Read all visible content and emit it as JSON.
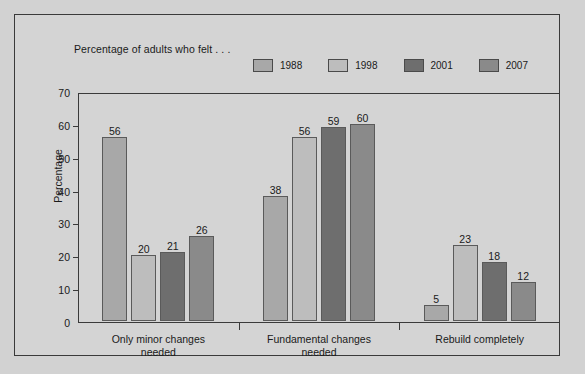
{
  "caption": "Percentage of adults who felt . . .",
  "chart_data": {
    "type": "bar",
    "title": "Percentage of adults who felt . . .",
    "xlabel": "",
    "ylabel": "Percentage",
    "ylim": [
      0,
      70
    ],
    "yticks": [
      0,
      10,
      20,
      30,
      40,
      50,
      60,
      70
    ],
    "grid": false,
    "legend_position": "top",
    "categories": [
      "Only minor changes needed",
      "Fundamental changes needed",
      "Rebuild completely"
    ],
    "category_lines": [
      [
        "Only minor changes",
        "needed"
      ],
      [
        "Fundamental changes",
        "needed"
      ],
      [
        "Rebuild completely",
        ""
      ]
    ],
    "series": [
      {
        "name": "1988",
        "color": "#a8a8a8",
        "values": [
          56,
          38,
          5
        ]
      },
      {
        "name": "1998",
        "color": "#bdbdbd",
        "values": [
          20,
          56,
          23
        ]
      },
      {
        "name": "2001",
        "color": "#6e6e6e",
        "values": [
          21,
          59,
          18
        ]
      },
      {
        "name": "2007",
        "color": "#8a8a8a",
        "values": [
          26,
          60,
          12
        ]
      }
    ]
  },
  "colors": {
    "background": "#d2d2d2",
    "panel": "#d4d4d4",
    "axis": "#3a3a3a",
    "text": "#1a1a1a"
  }
}
